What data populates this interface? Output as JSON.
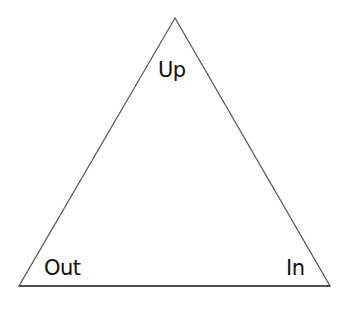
{
  "diagram": {
    "shape": "triangle",
    "stroke_color": "#555555",
    "vertices": {
      "top": [
        175,
        18
      ],
      "bottom_left": [
        19,
        286
      ],
      "bottom_right": [
        330,
        286
      ]
    },
    "labels": {
      "top": "Up",
      "bottom_left": "Out",
      "bottom_right": "In"
    }
  }
}
